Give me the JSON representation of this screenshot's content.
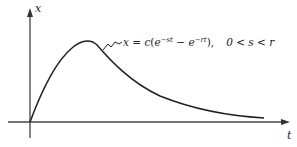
{
  "figure": {
    "axes": {
      "y_label": "x",
      "x_label": "t"
    },
    "curve": {
      "description": "Rise from origin to a single peak, then exponential decay toward the t-axis",
      "equation": {
        "lhs": "x",
        "equals": "=",
        "coef": "c",
        "term1_base": "e",
        "term1_exp": "−st",
        "minus": "−",
        "term2_base": "e",
        "term2_exp": "−rt",
        "comma": ",",
        "condition": "0 < s < r"
      }
    },
    "colors": {
      "ink": "#222222",
      "axis": "#444444",
      "background": "#ffffff"
    }
  }
}
